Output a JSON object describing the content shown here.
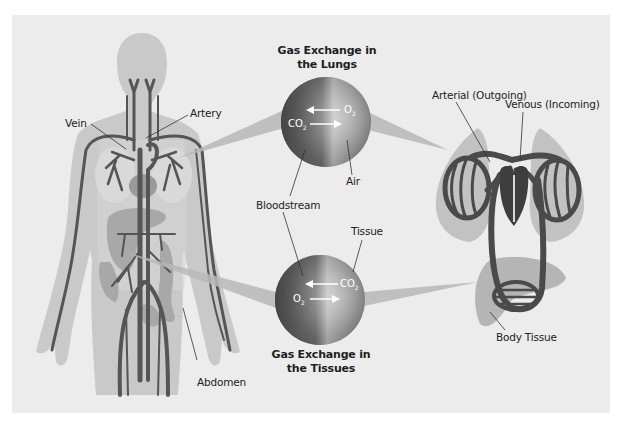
{
  "diagram": {
    "colors": {
      "background": "#ececec",
      "body_silhouette": "#c9c9c9",
      "vessel": "#555555",
      "heart": "#9a9a9a",
      "organ": "#a8a8a8",
      "lung_shadow": "#c2c2c2",
      "circuit": "#4a4a4a",
      "sphere_dark": "#4d4d4d",
      "sphere_light": "#c8c8c8"
    },
    "body_labels": {
      "vein": "Vein",
      "artery": "Artery",
      "abdomen": "Abdomen"
    },
    "lungs_exchange": {
      "title_line1": "Gas Exchange in",
      "title_line2": "the Lungs",
      "gas_in": "O",
      "gas_in_sub": "2",
      "gas_out": "CO",
      "gas_out_sub": "2",
      "air_label": "Air"
    },
    "tissue_exchange": {
      "title_line1": "Gas Exchange in",
      "title_line2": "the Tissues",
      "gas_in": "CO",
      "gas_in_sub": "2",
      "gas_out": "O",
      "gas_out_sub": "2",
      "tissue_label": "Tissue"
    },
    "shared_labels": {
      "bloodstream": "Bloodstream"
    },
    "circuit_labels": {
      "arterial": "Arterial (Outgoing)",
      "venous": "Venous (Incoming)",
      "body_tissue": "Body Tissue"
    }
  }
}
